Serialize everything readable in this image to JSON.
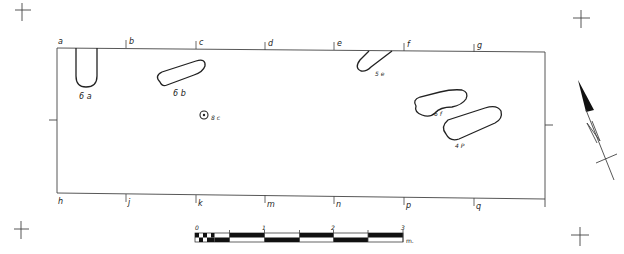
{
  "plan": {
    "grid_labels_top": [
      {
        "label": "a",
        "x": 58
      },
      {
        "label": "b",
        "x": 126
      },
      {
        "label": "c",
        "x": 196
      },
      {
        "label": "d",
        "x": 265
      },
      {
        "label": "e",
        "x": 334
      },
      {
        "label": "f",
        "x": 404
      },
      {
        "label": "g",
        "x": 474
      }
    ],
    "grid_labels_bottom": [
      {
        "label": "h",
        "x": 58
      },
      {
        "label": "j",
        "x": 126
      },
      {
        "label": "k",
        "x": 196
      },
      {
        "label": "m",
        "x": 265
      },
      {
        "label": "n",
        "x": 334
      },
      {
        "label": "p",
        "x": 404
      },
      {
        "label": "q",
        "x": 474
      }
    ],
    "features": [
      {
        "id": "6a",
        "label": "6 a"
      },
      {
        "id": "6b",
        "label": "6 b"
      },
      {
        "id": "5e",
        "label": "5 e"
      },
      {
        "id": "6f",
        "label": "6 f"
      },
      {
        "id": "4p",
        "label": "4 P"
      },
      {
        "id": "8c",
        "label": "8 c"
      }
    ]
  },
  "scale_bar": {
    "ticks": [
      "0",
      "1",
      "2",
      "3"
    ],
    "unit": "m."
  },
  "north_arrow": {
    "label": "N"
  }
}
